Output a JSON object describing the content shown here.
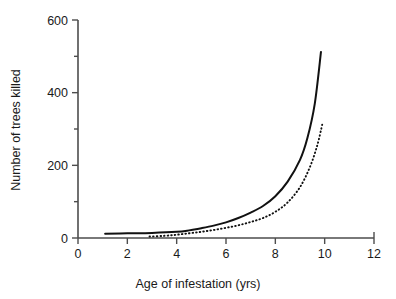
{
  "chart_data": {
    "type": "line",
    "title": "",
    "xlabel": "Age of infestation (yrs)",
    "ylabel": "Number of trees killed",
    "xlim": [
      0,
      12
    ],
    "ylim": [
      0,
      600
    ],
    "grid": false,
    "legend": "none",
    "x_ticks": [
      0,
      2,
      4,
      6,
      8,
      10,
      12
    ],
    "x_tick_labels": [
      "0",
      "2",
      "4",
      "6",
      "8",
      "10",
      "12"
    ],
    "y_ticks": [
      0,
      200,
      400,
      600
    ],
    "y_tick_labels": [
      "0",
      "200",
      "400",
      "600"
    ],
    "y_minor_ticks": [
      100,
      300,
      500
    ],
    "series": [
      {
        "name": "solid-curve",
        "style": "solid",
        "color": "#111111",
        "x": [
          1.1,
          2.0,
          3.0,
          4.0,
          4.5,
          5.0,
          5.5,
          6.0,
          6.5,
          7.0,
          7.5,
          8.0,
          8.5,
          9.0,
          9.3,
          9.6,
          9.85
        ],
        "y": [
          12,
          13,
          14,
          17,
          21,
          27,
          34,
          43,
          55,
          70,
          88,
          115,
          155,
          215,
          275,
          370,
          512
        ]
      },
      {
        "name": "dotted-curve",
        "style": "dotted",
        "color": "#111111",
        "x": [
          2.9,
          3.5,
          4.0,
          4.5,
          5.0,
          5.5,
          6.0,
          6.5,
          7.0,
          7.5,
          8.0,
          8.5,
          9.0,
          9.4,
          9.7,
          9.9
        ],
        "y": [
          4,
          6,
          9,
          13,
          17,
          22,
          28,
          35,
          44,
          55,
          72,
          98,
          140,
          195,
          255,
          312
        ]
      }
    ]
  },
  "labels": {
    "x_axis_title": "Age of infestation (yrs)",
    "y_axis_title": "Number of trees killed"
  }
}
